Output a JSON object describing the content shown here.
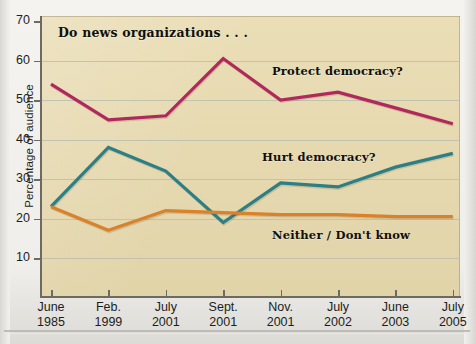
{
  "chart_data": {
    "type": "line",
    "title": "Do news organizations . . .",
    "xlabel": "",
    "ylabel": "Percentage of audience",
    "ylim": [
      0,
      70
    ],
    "yticks": [
      10,
      20,
      30,
      40,
      50,
      60,
      70
    ],
    "grid": true,
    "legend_position": "inline-annotations",
    "categories": [
      "June 1985",
      "Feb. 1999",
      "July 2001",
      "Sept. 2001",
      "Nov. 2001",
      "July 2002",
      "June 2003",
      "July 2005"
    ],
    "category_lines": [
      [
        "June",
        "1985"
      ],
      [
        "Feb.",
        "1999"
      ],
      [
        "July",
        "2001"
      ],
      [
        "Sept.",
        "2001"
      ],
      [
        "Nov.",
        "2001"
      ],
      [
        "July",
        "2002"
      ],
      [
        "June",
        "2003"
      ],
      [
        "July",
        "2005"
      ]
    ],
    "series": [
      {
        "name": "Protect democracy?",
        "color": "#b1295c",
        "values": [
          54,
          45,
          46,
          60.5,
          50,
          52,
          48,
          44
        ]
      },
      {
        "name": "Hurt democracy?",
        "color": "#2b7f85",
        "values": [
          23,
          38,
          32,
          19,
          29,
          28,
          33,
          36.5
        ]
      },
      {
        "name": "Neither / Don't know",
        "color": "#d9822b",
        "values": [
          23,
          17,
          22,
          21.5,
          21,
          21,
          20.5,
          20.5
        ]
      }
    ],
    "annotations": [
      {
        "text": "Do news organizations . . .",
        "kind": "title"
      },
      {
        "text": "Protect democracy?",
        "kind": "series-label"
      },
      {
        "text": "Hurt democracy?",
        "kind": "series-label"
      },
      {
        "text": "Neither / Don't know",
        "kind": "series-label"
      }
    ]
  },
  "colors": {
    "plot_background": "#e9dcb2",
    "page_background": "#f2f1ee",
    "axis": "#6d6a62",
    "gridline": "#b7b9b0",
    "text": "#1d1d1b"
  }
}
